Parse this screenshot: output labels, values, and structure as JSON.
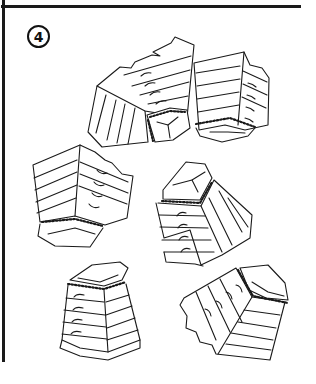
{
  "page": {
    "exercise_number": "4",
    "frame_color": "#1a1a1a",
    "background": "#ffffff"
  },
  "illustration": {
    "subject": "vaulting-box",
    "count": 6,
    "items": [
      {
        "id": 1,
        "orientation": "tilted-left, top facing lower-right"
      },
      {
        "id": 2,
        "orientation": "tilted-right, top facing lower-left"
      },
      {
        "id": 3,
        "orientation": "tilted-right, top facing down"
      },
      {
        "id": 4,
        "orientation": "tilted-left, top facing upper-left"
      },
      {
        "id": 5,
        "orientation": "upright"
      },
      {
        "id": 6,
        "orientation": "lying on side, top facing right"
      }
    ]
  }
}
